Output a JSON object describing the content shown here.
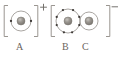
{
  "figure": {
    "title": "",
    "background": "#ffffff",
    "ink": "#6b6560",
    "nucleus_fill": "#8c8881",
    "dot_color": "#3f3b38"
  },
  "labels": {
    "a": "A",
    "b": "B",
    "c": "C"
  },
  "charges": {
    "left_ion": "+",
    "right_ion": "−"
  },
  "structures": [
    {
      "id": "ion-a",
      "name": "cation-bracket",
      "charge": "+",
      "bracket": {
        "left_x": 4,
        "right_x": 38,
        "top_y": 5,
        "bottom_y": 37
      },
      "atoms": [
        {
          "label": "A",
          "center_x": 21,
          "center_y": 21,
          "shell_radius": 10,
          "nucleus_radius": 4,
          "electron_dots": 2,
          "dot_angles_deg": [
            180,
            0
          ]
        }
      ]
    },
    {
      "id": "ion-bc",
      "name": "anion-bracket",
      "charge": "−",
      "bracket": {
        "left_x": 51,
        "right_x": 110,
        "top_y": 5,
        "bottom_y": 37
      },
      "atoms": [
        {
          "label": "B",
          "center_x": 68,
          "center_y": 21,
          "shell_radius": 12,
          "nucleus_radius": 4,
          "electron_dots": 8,
          "dot_angles_deg": [
            200,
            160,
            245,
            115,
            290,
            70,
            340,
            20
          ]
        },
        {
          "label": "C",
          "center_x": 89,
          "center_y": 21,
          "shell_radius": 9,
          "nucleus_radius": 4,
          "electron_dots": 0,
          "dot_angles_deg": []
        }
      ]
    }
  ]
}
